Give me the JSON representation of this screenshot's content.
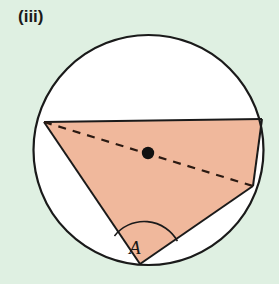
{
  "figure": {
    "part_label": "(iii)",
    "angle_label": "A",
    "caption_alt": "Circle with inscribed triangle, shaded, diameter drawn as dashed line through centre, angle A marked at the bottom vertex",
    "colors": {
      "background": "#dff0e2",
      "shaded_region": "#f0b89c",
      "circle_interior": "#ffffff",
      "stroke": "#1a1a1a",
      "centre_dot": "#111111",
      "label_text": "#1a1a1a"
    },
    "geometry": {
      "circle": {
        "cx": 148.5,
        "cy": 150,
        "r": 115
      },
      "centre_dot": {
        "cx": 148,
        "cy": 153,
        "r": 6
      },
      "vertices": {
        "top_left": {
          "x": 44,
          "y": 122
        },
        "top_right": {
          "x": 262,
          "y": 119
        },
        "bottom": {
          "x": 140,
          "y": 264
        }
      },
      "dashed_diameter": {
        "from": {
          "x": 44,
          "y": 122
        },
        "to": {
          "x": 253,
          "y": 186
        }
      },
      "angle_arc": {
        "vertex": {
          "x": 140,
          "y": 264
        },
        "radius": 38
      }
    }
  }
}
